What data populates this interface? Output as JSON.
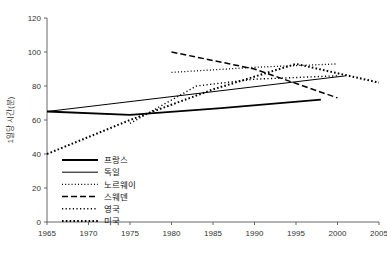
{
  "chart_data": {
    "type": "line",
    "title": "",
    "xlabel": "",
    "ylabel": "1일당 시간(분)",
    "xlim": [
      1965,
      2005
    ],
    "ylim": [
      0,
      120
    ],
    "xticks": [
      1965,
      1970,
      1975,
      1980,
      1985,
      1990,
      1995,
      2000,
      2005
    ],
    "yticks": [
      0,
      20,
      40,
      60,
      80,
      100,
      120
    ],
    "grid": false,
    "legend_position": "lower-left-inside",
    "series": [
      {
        "name": "프랑스",
        "style": "solid-thick",
        "x": [
          1965,
          1975,
          1986,
          1998
        ],
        "values": [
          65,
          63,
          67,
          72
        ]
      },
      {
        "name": "독일",
        "style": "solid",
        "x": [
          1965,
          2001
        ],
        "values": [
          65,
          86
        ]
      },
      {
        "name": "노르웨이",
        "style": "fine-dotted",
        "x": [
          1980,
          1990,
          2000
        ],
        "values": [
          88,
          91,
          93
        ]
      },
      {
        "name": "스웨덴",
        "style": "dashed",
        "x": [
          1980,
          1990,
          2000
        ],
        "values": [
          100,
          90,
          73
        ]
      },
      {
        "name": "영국",
        "style": "dotted",
        "x": [
          1975,
          1983,
          1990,
          2000
        ],
        "values": [
          58,
          80,
          84,
          86
        ]
      },
      {
        "name": "미국",
        "style": "bold-dotted",
        "x": [
          1965,
          1975,
          1985,
          1995,
          2005
        ],
        "values": [
          40,
          60,
          78,
          93,
          82
        ]
      }
    ]
  },
  "legend": {
    "items": [
      {
        "label": "프랑스",
        "style": "solid-thick"
      },
      {
        "label": "독일",
        "style": "solid"
      },
      {
        "label": "노르웨이",
        "style": "fine-dotted"
      },
      {
        "label": "스웨덴",
        "style": "dashed"
      },
      {
        "label": "영국",
        "style": "dotted"
      },
      {
        "label": "미국",
        "style": "bold-dotted"
      }
    ]
  },
  "colors": {
    "line": "#000000",
    "axis": "#555555",
    "text": "#222222",
    "background": "#ffffff"
  }
}
